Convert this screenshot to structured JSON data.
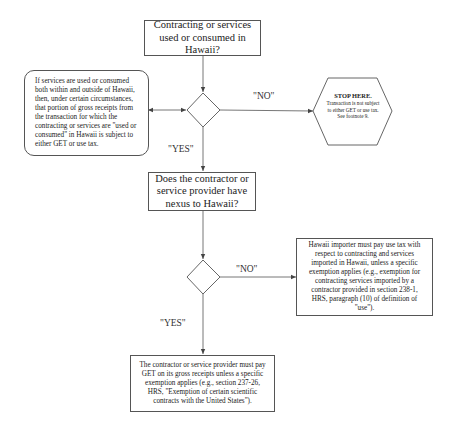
{
  "diagram": {
    "type": "flowchart",
    "nodes": {
      "q1": {
        "shape": "rectangle",
        "text": "Contracting or services used or consumed in Hawaii?"
      },
      "d1": {
        "shape": "diamond",
        "text": ""
      },
      "mixed_use_note": {
        "shape": "rounded-rectangle",
        "text": "If services are used or consumed both within and outside of Hawaii, then, under certain circumstances, that portion of gross receipts from the transaction for which the contracting or services are \"used or consumed\" in Hawaii is subject to either GET or use tax."
      },
      "stop": {
        "shape": "hexagon",
        "title": "STOP HERE.",
        "text": "Transaction is not subject to either GET or use tax. See footnote 9."
      },
      "q2": {
        "shape": "rectangle",
        "text": "Does the contractor or service provider have nexus to Hawaii?"
      },
      "d2": {
        "shape": "diamond",
        "text": ""
      },
      "use_tax": {
        "shape": "rectangle",
        "text": "Hawaii importer must pay use tax with respect to contracting and services imported in Hawaii, unless a specific exemption applies (e.g., exemption for contracting services imported by a contractor provided in section 238-1, HRS, paragraph (10) of definition of \"use\")."
      },
      "get": {
        "shape": "rectangle",
        "text": "The contractor or service provider must pay GET on its gross receipts unless a specific exemption applies (e.g., section 237-26, HRS, \"Exemption of certain scientific contracts with the United States\")."
      }
    },
    "edges": [
      {
        "from": "q1",
        "to": "d1",
        "label": ""
      },
      {
        "from": "d1",
        "to": "stop",
        "label": "\"NO\""
      },
      {
        "from": "d1",
        "to": "mixed_use_note",
        "label": "",
        "bidirectional": true
      },
      {
        "from": "d1",
        "to": "q2",
        "label": "\"YES\""
      },
      {
        "from": "q2",
        "to": "d2",
        "label": ""
      },
      {
        "from": "d2",
        "to": "use_tax",
        "label": "\"NO\""
      },
      {
        "from": "d2",
        "to": "get",
        "label": "\"YES\""
      }
    ],
    "labels": {
      "no1": "\"NO\"",
      "yes1": "\"YES\"",
      "no2": "\"NO\"",
      "yes2": "\"YES\""
    },
    "colors": {
      "line": "#555555",
      "text": "#222222",
      "background": "#ffffff"
    }
  }
}
